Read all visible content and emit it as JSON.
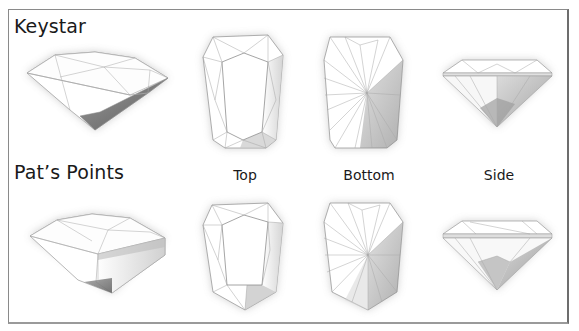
{
  "figure": {
    "rows": [
      {
        "title": "Keystar"
      },
      {
        "title": "Pat’s Points"
      }
    ],
    "view_labels": [
      {
        "label": "Top"
      },
      {
        "label": "Bottom"
      },
      {
        "label": "Side"
      }
    ],
    "views_per_row": [
      "perspective",
      "top",
      "bottom",
      "side"
    ],
    "colors": {
      "frame": "#8a8a8a",
      "facet_line": "#9a9a9a",
      "pavilion_shadow": "#7a7a7a",
      "text": "#1a1a1a"
    }
  }
}
